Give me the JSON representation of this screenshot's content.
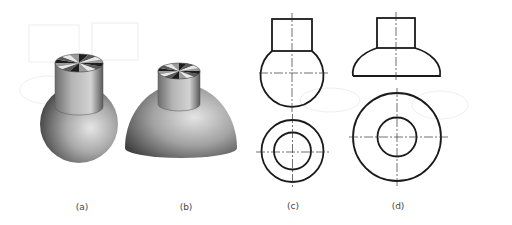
{
  "figure": {
    "panels": [
      {
        "id": "a",
        "label": "(a)",
        "type": "3d-render",
        "shape": "cylinder-on-sphere"
      },
      {
        "id": "b",
        "label": "(b)",
        "type": "3d-render",
        "shape": "cylinder-on-hemisphere"
      },
      {
        "id": "c",
        "label": "(c)",
        "type": "orthographic-views",
        "shape": "cylinder-on-sphere",
        "views": [
          "front",
          "top"
        ]
      },
      {
        "id": "d",
        "label": "(d)",
        "type": "orthographic-views",
        "shape": "cylinder-on-hemisphere",
        "views": [
          "front",
          "top"
        ]
      }
    ],
    "colors": {
      "line": "#1a1a1a",
      "center_line": "#333333",
      "solid_light": "#d8d8d8",
      "solid_dark": "#4a4a4a",
      "background": "#ffffff"
    }
  }
}
